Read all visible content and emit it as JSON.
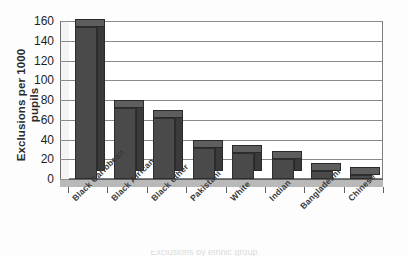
{
  "chart_data": {
    "type": "bar",
    "title": "",
    "subtitle": "",
    "xlabel": "",
    "ylabel": "Exclusions per 1000 pupils",
    "ylabel_line1": "Exclusions per 1000",
    "ylabel_line2": "pupils",
    "categories": [
      "Black Caribbean",
      "Black African",
      "Black other",
      "Pakistani",
      "White",
      "Indian",
      "Bangladeshi",
      "Chinese"
    ],
    "values": [
      154,
      72,
      62,
      31,
      26,
      20,
      8,
      4
    ],
    "ylim": [
      0,
      160
    ],
    "ytick_values": [
      0,
      20,
      40,
      60,
      80,
      100,
      120,
      140,
      160
    ],
    "ytick_labels": [
      "0",
      "20",
      "40",
      "60",
      "80",
      "100",
      "120",
      "140",
      "160"
    ],
    "grid": true,
    "grid_axis": "y",
    "legend": false,
    "legend_position": "none",
    "bar_color": "#4a4a4a",
    "bar_side_color": "#3a3a3a",
    "bar_top_color": "#5e5e5e",
    "axis_color": "#6f6f6f",
    "gridline_color": "#8a8a8a",
    "background_color": "#ffffff",
    "style": "3d-bar",
    "xlabel_rotation": -45
  },
  "footer": {
    "cutoff_text": "Exclusions by ethnic group"
  }
}
